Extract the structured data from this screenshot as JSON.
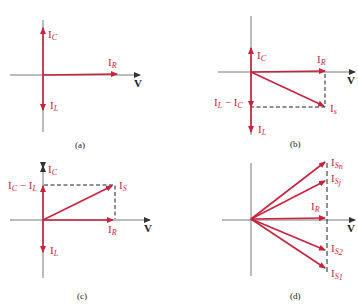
{
  "colors": {
    "vector": "#c4243f",
    "axis": "#333333",
    "dash": "#222222"
  },
  "panels": {
    "a": {
      "caption": "(a)",
      "labels": {
        "ic": "I",
        "ic_sub": "C",
        "ir": "I",
        "ir_sub": "R",
        "il": "I",
        "il_sub": "L",
        "v": "V"
      }
    },
    "b": {
      "caption": "(b)",
      "labels": {
        "ic": "I",
        "ic_sub": "C",
        "ir": "I",
        "ir_sub": "R",
        "il": "I",
        "il_sub": "L",
        "diff": "I",
        "diff_sub1": "L",
        "diff_mid": " − I",
        "diff_sub2": "C",
        "is": "I",
        "is_sub": "s",
        "v": "V"
      }
    },
    "c": {
      "caption": "(c)",
      "labels": {
        "ic": "I",
        "ic_sub": "C",
        "ir": "I",
        "ir_sub": "R",
        "il": "I",
        "il_sub": "L",
        "diff": "I",
        "diff_sub1": "C",
        "diff_mid": " − I",
        "diff_sub2": "L",
        "is": "I",
        "is_sub": "S",
        "v": "V"
      }
    },
    "d": {
      "caption": "(d)",
      "labels": {
        "isn": "I",
        "isn_sub": "S",
        "isn_subsub": "n",
        "isj": "I",
        "isj_sub": "S",
        "isj_subsub": "j",
        "ir": "I",
        "ir_sub": "R",
        "is2": "I",
        "is2_sub": "S",
        "is2_subsub": "2",
        "is1": "I",
        "is1_sub": "S",
        "is1_subsub": "1",
        "v": "V"
      }
    }
  }
}
